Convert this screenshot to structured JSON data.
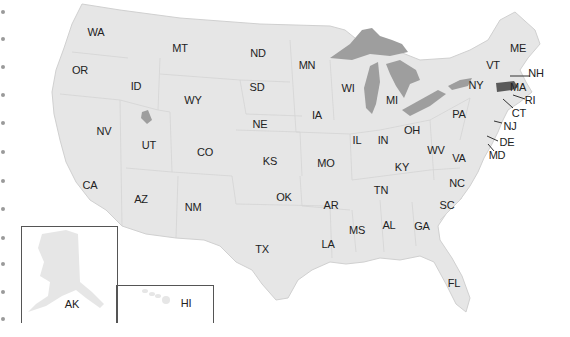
{
  "map": {
    "title": "United States",
    "highlighted_state": "MA",
    "colors": {
      "state_fill": "#e6e6e6",
      "state_border": "#cfcfcf",
      "water": "#9e9e9e",
      "highlight": "#5a5a5a",
      "label": "#222222"
    },
    "labels": [
      {
        "code": "WA",
        "x": 96,
        "y": 32
      },
      {
        "code": "MT",
        "x": 180,
        "y": 48
      },
      {
        "code": "ND",
        "x": 258,
        "y": 53
      },
      {
        "code": "MN",
        "x": 307,
        "y": 65
      },
      {
        "code": "OR",
        "x": 80,
        "y": 70
      },
      {
        "code": "ID",
        "x": 136,
        "y": 86
      },
      {
        "code": "SD",
        "x": 257,
        "y": 87
      },
      {
        "code": "WY",
        "x": 193,
        "y": 100
      },
      {
        "code": "WI",
        "x": 348,
        "y": 88
      },
      {
        "code": "MI",
        "x": 392,
        "y": 100
      },
      {
        "code": "NY",
        "x": 476,
        "y": 85
      },
      {
        "code": "VT",
        "x": 493,
        "y": 65
      },
      {
        "code": "ME",
        "x": 518,
        "y": 48
      },
      {
        "code": "NH",
        "x": 536,
        "y": 73
      },
      {
        "code": "MA",
        "x": 518,
        "y": 87
      },
      {
        "code": "RI",
        "x": 530,
        "y": 100
      },
      {
        "code": "CT",
        "x": 519,
        "y": 113
      },
      {
        "code": "NJ",
        "x": 510,
        "y": 126
      },
      {
        "code": "DE",
        "x": 507,
        "y": 142
      },
      {
        "code": "MD",
        "x": 497,
        "y": 155
      },
      {
        "code": "PA",
        "x": 459,
        "y": 114
      },
      {
        "code": "IA",
        "x": 317,
        "y": 115
      },
      {
        "code": "NE",
        "x": 260,
        "y": 124
      },
      {
        "code": "NV",
        "x": 104,
        "y": 131
      },
      {
        "code": "UT",
        "x": 149,
        "y": 145
      },
      {
        "code": "IL",
        "x": 357,
        "y": 140
      },
      {
        "code": "IN",
        "x": 383,
        "y": 140
      },
      {
        "code": "OH",
        "x": 412,
        "y": 130
      },
      {
        "code": "CO",
        "x": 205,
        "y": 152
      },
      {
        "code": "WV",
        "x": 436,
        "y": 150
      },
      {
        "code": "VA",
        "x": 459,
        "y": 158
      },
      {
        "code": "KS",
        "x": 270,
        "y": 161
      },
      {
        "code": "MO",
        "x": 326,
        "y": 163
      },
      {
        "code": "KY",
        "x": 402,
        "y": 167
      },
      {
        "code": "CA",
        "x": 90,
        "y": 185
      },
      {
        "code": "NC",
        "x": 457,
        "y": 183
      },
      {
        "code": "TN",
        "x": 381,
        "y": 190
      },
      {
        "code": "OK",
        "x": 284,
        "y": 197
      },
      {
        "code": "AZ",
        "x": 141,
        "y": 199
      },
      {
        "code": "AR",
        "x": 331,
        "y": 205
      },
      {
        "code": "SC",
        "x": 447,
        "y": 205
      },
      {
        "code": "NM",
        "x": 193,
        "y": 207
      },
      {
        "code": "MS",
        "x": 357,
        "y": 230
      },
      {
        "code": "AL",
        "x": 389,
        "y": 225
      },
      {
        "code": "GA",
        "x": 422,
        "y": 226
      },
      {
        "code": "LA",
        "x": 328,
        "y": 244
      },
      {
        "code": "TX",
        "x": 262,
        "y": 249
      },
      {
        "code": "FL",
        "x": 454,
        "y": 283
      },
      {
        "code": "AK",
        "x": 72,
        "y": 304
      },
      {
        "code": "HI",
        "x": 186,
        "y": 303
      }
    ],
    "leader_lines": [
      {
        "code": "NH",
        "x1": 510,
        "y1": 76,
        "x2": 530,
        "y2": 76
      },
      {
        "code": "RI",
        "x1": 513,
        "y1": 95,
        "x2": 525,
        "y2": 99
      },
      {
        "code": "CT",
        "x1": 503,
        "y1": 99,
        "x2": 513,
        "y2": 108
      },
      {
        "code": "NJ",
        "x1": 494,
        "y1": 121,
        "x2": 502,
        "y2": 123
      },
      {
        "code": "DE",
        "x1": 487,
        "y1": 136,
        "x2": 498,
        "y2": 141
      },
      {
        "code": "MD",
        "x1": 488,
        "y1": 144,
        "x2": 494,
        "y2": 151
      }
    ],
    "edge_dots_y": [
      10,
      37,
      65,
      93,
      121,
      150,
      179,
      207,
      236,
      262,
      290,
      317
    ],
    "insets": [
      {
        "name": "alaska-inset",
        "label": "AK",
        "x": 21,
        "y": 226,
        "w": 95,
        "h": 96
      },
      {
        "name": "hawaii-inset",
        "label": "HI",
        "x": 116,
        "y": 285,
        "w": 96,
        "h": 37
      }
    ]
  }
}
